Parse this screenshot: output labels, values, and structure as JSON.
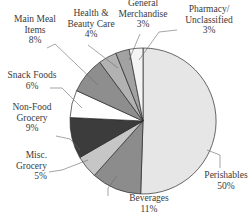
{
  "chart_data": {
    "type": "pie",
    "title": "",
    "start": "12 o'clock",
    "direction": "clockwise",
    "slices": [
      {
        "label": [
          "Perishables"
        ],
        "pct_text": "50%",
        "value": 50,
        "color": "#e6e6e6"
      },
      {
        "label": [
          "Beverages"
        ],
        "pct_text": "11%",
        "value": 11,
        "color": "#8c8c8c"
      },
      {
        "label": [
          "Misc.",
          "Grocery"
        ],
        "pct_text": "5%",
        "value": 5,
        "color": "#c6c6c6"
      },
      {
        "label": [
          "Non-Food",
          "Grocery"
        ],
        "pct_text": "9%",
        "value": 9,
        "color": "#3c3c3c"
      },
      {
        "label": [
          "Snack Foods"
        ],
        "pct_text": "6%",
        "value": 6,
        "color": "#ffffff"
      },
      {
        "label": [
          "Main Meal",
          "Items"
        ],
        "pct_text": "8%",
        "value": 8,
        "color": "#8e8e8e"
      },
      {
        "label": [
          "Health &",
          "Beauty Care"
        ],
        "pct_text": "4%",
        "value": 4,
        "color": "#b2b2b2"
      },
      {
        "label": [
          "General",
          "Merchandise"
        ],
        "pct_text": "3%",
        "value": 3,
        "color": "#a2a2a2"
      },
      {
        "label": [
          "Pharmacy/",
          "Unclassified"
        ],
        "pct_text": "3%",
        "value": 3,
        "color": "#f4f4f4"
      }
    ],
    "legend": "none (callout labels)"
  }
}
